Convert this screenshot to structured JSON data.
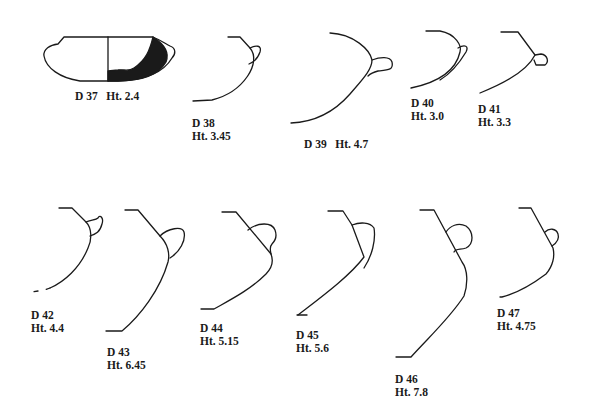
{
  "figure": {
    "type": "pottery profile drawings",
    "vessels": [
      {
        "id": "D 37",
        "height": "Ht. 2.4",
        "label_line1": "D 37",
        "label_line2": "Ht. 2.4",
        "single_line": true
      },
      {
        "id": "D 38",
        "label_line1": "D 38",
        "label_line2": "Ht. 3.45"
      },
      {
        "id": "D 39",
        "label_line1": "D 39",
        "label_line2": "Ht. 4.7",
        "single_line": true
      },
      {
        "id": "D 40",
        "label_line1": "D 40",
        "label_line2": "Ht. 3.0"
      },
      {
        "id": "D 41",
        "label_line1": "D 41",
        "label_line2": "Ht. 3.3"
      },
      {
        "id": "D 42",
        "label_line1": "D 42",
        "label_line2": "Ht. 4.4"
      },
      {
        "id": "D 43",
        "label_line1": "D 43",
        "label_line2": "Ht. 6.45"
      },
      {
        "id": "D 44",
        "label_line1": "D 44",
        "label_line2": "Ht. 5.15"
      },
      {
        "id": "D 45",
        "label_line1": "D 45",
        "label_line2": "Ht. 5.6"
      },
      {
        "id": "D 46",
        "label_line1": "D 46",
        "label_line2": "Ht. 7.8"
      },
      {
        "id": "D 47",
        "label_line1": "D 47",
        "label_line2": "Ht. 4.75"
      }
    ]
  }
}
